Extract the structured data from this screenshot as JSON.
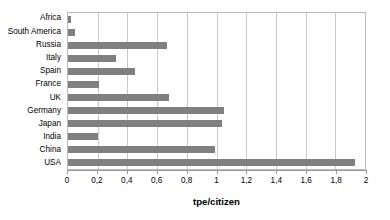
{
  "chart_data": {
    "type": "bar",
    "orientation": "horizontal",
    "title": "",
    "subtitle": "",
    "xlabel": "tpe/citizen",
    "ylabel": "",
    "xlim": [
      0,
      2
    ],
    "grid": true,
    "legend": false,
    "legend_position": "none",
    "bar_color": "#808080",
    "gridline_color": "#c8c8c8",
    "plot_border_color": "#b9b9b9",
    "decimal_separator": ",",
    "categories": [
      "Africa",
      "South America",
      "Russia",
      "Italy",
      "Spain",
      "France",
      "UK",
      "Germany",
      "Japan",
      "India",
      "China",
      "USA"
    ],
    "values": [
      0.02,
      0.05,
      0.67,
      0.32,
      0.45,
      0.21,
      0.68,
      1.05,
      1.04,
      0.2,
      0.99,
      1.93
    ],
    "xticks": [
      0,
      0.2,
      0.4,
      0.6,
      0.8,
      1,
      1.2,
      1.4,
      1.6,
      1.8,
      2
    ],
    "xtick_labels": [
      "0",
      "0,2",
      "0,4",
      "0,6",
      "0,8",
      "1",
      "1,2",
      "1,4",
      "1,6",
      "1,8",
      "2"
    ]
  }
}
